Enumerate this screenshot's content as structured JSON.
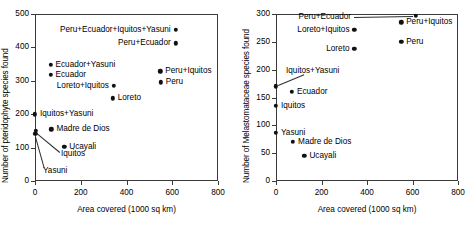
{
  "chart_data": [
    {
      "type": "scatter",
      "panel": "left",
      "title": "",
      "xlabel": "Area covered (1000 sq km)",
      "ylabel": "Number of pteridophyte species found",
      "xlim": [
        0,
        800
      ],
      "ylim": [
        0,
        500
      ],
      "xticks": [
        0,
        200,
        400,
        600,
        800
      ],
      "yticks": [
        0,
        100,
        200,
        300,
        400,
        500
      ],
      "grid": false,
      "legend": "none",
      "points": [
        {
          "label": "Peru+Ecuador+Iquitos+Yasuni",
          "x": 615,
          "y": 452,
          "label_side": "left"
        },
        {
          "label": "Peru+Ecuador",
          "x": 615,
          "y": 412,
          "label_side": "left"
        },
        {
          "label": "Ecuador+Yasuni",
          "x": 68,
          "y": 348,
          "label_side": "right"
        },
        {
          "label": "Ecuador",
          "x": 68,
          "y": 318,
          "label_side": "right"
        },
        {
          "label": "Peru+Iquitos",
          "x": 548,
          "y": 328,
          "label_side": "right"
        },
        {
          "label": "Peru",
          "x": 550,
          "y": 295,
          "label_side": "right"
        },
        {
          "label": "Loreto+Iquitos",
          "x": 345,
          "y": 285,
          "label_side": "left"
        },
        {
          "label": "Loreto",
          "x": 340,
          "y": 248,
          "label_side": "right"
        },
        {
          "label": "Iquitos+Yasuni",
          "x": 0,
          "y": 200,
          "label_side": "right"
        },
        {
          "label": "Madre de Dios",
          "x": 72,
          "y": 155,
          "label_side": "right"
        },
        {
          "label": "Ucayali",
          "x": 128,
          "y": 103,
          "label_side": "right"
        },
        {
          "label": "Iquitos",
          "x": 4,
          "y": 150,
          "label_side": "leader"
        },
        {
          "label": "Yasuni",
          "x": 2,
          "y": 142,
          "label_side": "leader"
        }
      ]
    },
    {
      "type": "scatter",
      "panel": "right",
      "title": "",
      "xlabel": "Area covered (1000 sq km)",
      "ylabel": "Number of Melastomataceae species found",
      "xlim": [
        0,
        800
      ],
      "ylim": [
        0,
        300
      ],
      "xticks": [
        0,
        200,
        400,
        600,
        800
      ],
      "yticks": [
        0,
        50,
        100,
        150,
        200,
        250,
        300
      ],
      "grid": false,
      "legend": "none",
      "points": [
        {
          "label": "Peru+Ecuador",
          "x": 615,
          "y": 297,
          "label_side": "leader"
        },
        {
          "label": "Peru+Iquitos",
          "x": 550,
          "y": 285,
          "label_side": "right"
        },
        {
          "label": "Loreto+Iquitos",
          "x": 345,
          "y": 272,
          "label_side": "left"
        },
        {
          "label": "Peru",
          "x": 550,
          "y": 250,
          "label_side": "right"
        },
        {
          "label": "Loreto",
          "x": 345,
          "y": 237,
          "label_side": "left"
        },
        {
          "label": "Iquitos+Yasuni",
          "x": 0,
          "y": 170,
          "label_side": "leader"
        },
        {
          "label": "Ecuador",
          "x": 70,
          "y": 160,
          "label_side": "right"
        },
        {
          "label": "Iquitos",
          "x": 0,
          "y": 135,
          "label_side": "right"
        },
        {
          "label": "Yasuni",
          "x": 0,
          "y": 87,
          "label_side": "right"
        },
        {
          "label": "Madre de Dios",
          "x": 75,
          "y": 70,
          "label_side": "right"
        },
        {
          "label": "Ucayali",
          "x": 125,
          "y": 45,
          "label_side": "right"
        }
      ]
    }
  ]
}
